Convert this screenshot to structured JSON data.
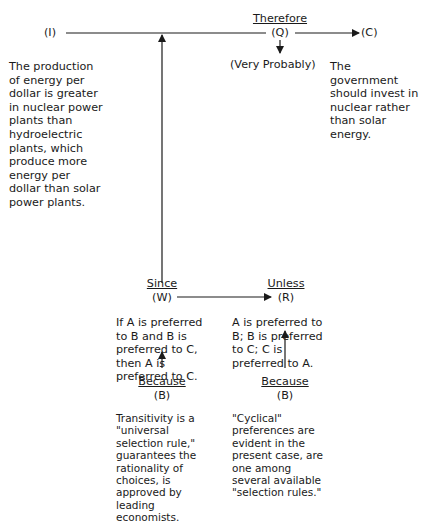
{
  "diagram": {
    "type": "Toulmin argument model",
    "data": {
      "symbol": "(I)",
      "text": "The production\nof energy per\ndollar is greater\nin nuclear power\nplants than\nhydroelectric\nplants, which\nproduce more\nenergy per\ndollar than solar\npower plants."
    },
    "qualifier": {
      "label": "Therefore",
      "symbol": "(Q)",
      "text": "(Very Probably)"
    },
    "claim": {
      "symbol": "(C)",
      "text": "The government\nshould invest in\nnuclear rather\nthan solar\nenergy."
    },
    "warrant": {
      "label": "Since",
      "symbol": "(W)",
      "text": "If A is preferred\nto B and B is\npreferred to C,\nthen A is\npreferred to C."
    },
    "rebuttal": {
      "label": "Unless",
      "symbol": "(R)",
      "text": "A is preferred to\nB; B is preferred\nto C; C is\npreferred to A."
    },
    "backing_warrant": {
      "label": "Because",
      "symbol": "(B)",
      "text": "Transitivity is a\n\"universal\nselection rule,\"\nguarantees the\nrationality of\nchoices, is\napproved by\nleading\neconomists."
    },
    "backing_rebuttal": {
      "label": "Because",
      "symbol": "(B)",
      "text": "\"Cyclical\"\npreferences are\nevident in the\npresent case, are\none among\nseveral available\n\"selection rules.\""
    }
  }
}
